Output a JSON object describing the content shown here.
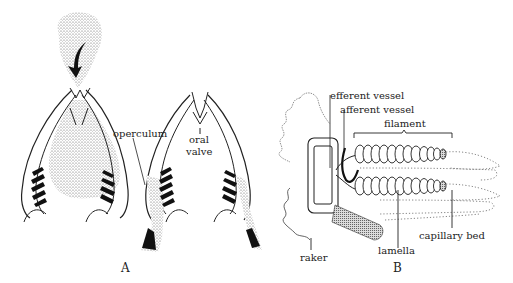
{
  "figure": {
    "panel_a": {
      "label": "A",
      "labels": {
        "operculum": "operculum",
        "oral_valve_line1": "oral",
        "oral_valve_line2": "valve"
      }
    },
    "panel_b": {
      "label": "B",
      "labels": {
        "efferent_vessel": "efferent vessel",
        "afferent_vessel": "afferent vessel",
        "filament": "filament",
        "raker": "raker",
        "lamella": "lamella",
        "capillary_bed": "capillary bed"
      }
    }
  }
}
